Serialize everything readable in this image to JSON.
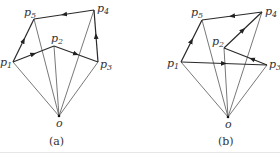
{
  "figures": [
    {
      "id": "a",
      "caption": "(a)",
      "origin_label": "o",
      "points": {
        "p1": {
          "label": "p",
          "sub": "1",
          "x": 13,
          "y": 62
        },
        "p2": {
          "label": "p",
          "sub": "2",
          "x": 54,
          "y": 46
        },
        "p3": {
          "label": "p",
          "sub": "3",
          "x": 98,
          "y": 62
        },
        "p4": {
          "label": "p",
          "sub": "4",
          "x": 94,
          "y": 10
        },
        "p5": {
          "label": "p",
          "sub": "5",
          "x": 34,
          "y": 19
        },
        "o": {
          "x": 59,
          "y": 116
        }
      },
      "directed_edges": [
        [
          "p1",
          "p2"
        ],
        [
          "p2",
          "p3"
        ],
        [
          "p3",
          "p4"
        ],
        [
          "p4",
          "p5"
        ],
        [
          "p1",
          "p5"
        ]
      ],
      "radials": [
        "p1",
        "p2",
        "p3",
        "p4",
        "p5"
      ]
    },
    {
      "id": "b",
      "caption": "(b)",
      "origin_label": "o",
      "points": {
        "p1": {
          "label": "p",
          "sub": "1",
          "x": 181,
          "y": 62
        },
        "p2": {
          "label": "p",
          "sub": "2",
          "x": 224,
          "y": 48
        },
        "p3": {
          "label": "p",
          "sub": "3",
          "x": 267,
          "y": 65
        },
        "p4": {
          "label": "p",
          "sub": "4",
          "x": 262,
          "y": 12
        },
        "p5": {
          "label": "p",
          "sub": "5",
          "x": 202,
          "y": 20
        },
        "o": {
          "x": 228,
          "y": 117
        }
      },
      "directed_edges": [
        [
          "p1",
          "p3"
        ],
        [
          "p3",
          "p2"
        ],
        [
          "p2",
          "p4"
        ],
        [
          "p4",
          "p5"
        ],
        [
          "p1",
          "p5"
        ]
      ],
      "radials": [
        "p1",
        "p2",
        "p3",
        "p4",
        "p5"
      ]
    }
  ],
  "labels": {
    "a": {
      "p1": "p",
      "p1s": "1",
      "p2": "p",
      "p2s": "2",
      "p3": "p",
      "p3s": "3",
      "p4": "p",
      "p4s": "4",
      "p5": "p",
      "p5s": "5",
      "o": "o",
      "caption": "(a)"
    },
    "b": {
      "p1": "p",
      "p1s": "1",
      "p2": "p",
      "p2s": "2",
      "p3": "p",
      "p3s": "3",
      "p4": "p",
      "p4s": "4",
      "p5": "p",
      "p5s": "5",
      "o": "o",
      "caption": "(b)"
    }
  }
}
